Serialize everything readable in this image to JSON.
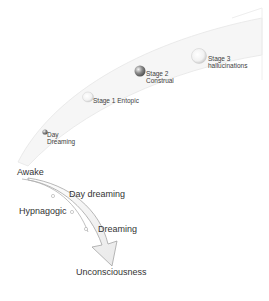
{
  "diagram": {
    "upper_arc": {
      "stages": [
        {
          "id": "day-dreaming",
          "label_line1": "Day",
          "label_line2": "Dreaming"
        },
        {
          "id": "stage-1",
          "label_line1": "Stage 1 Entopic",
          "label_line2": ""
        },
        {
          "id": "stage-2",
          "label_line1": "Stage 2",
          "label_line2": "Construal"
        },
        {
          "id": "stage-3",
          "label_line1": "Stage 3",
          "label_line2": "hallucinations"
        }
      ]
    },
    "lower_arrow": {
      "start_label": "Awake",
      "points": [
        "Day dreaming",
        "Hypnagogic",
        "Dreaming"
      ],
      "end_label": "Unconsciousness"
    },
    "colors": {
      "arc_fill": "#f2f2f2",
      "arc_stroke": "#d8d8d8",
      "arrow_stroke": "#9a9a9a",
      "ball_dark": "#6d6d6d",
      "ball_light": "#e6e6e6"
    }
  }
}
